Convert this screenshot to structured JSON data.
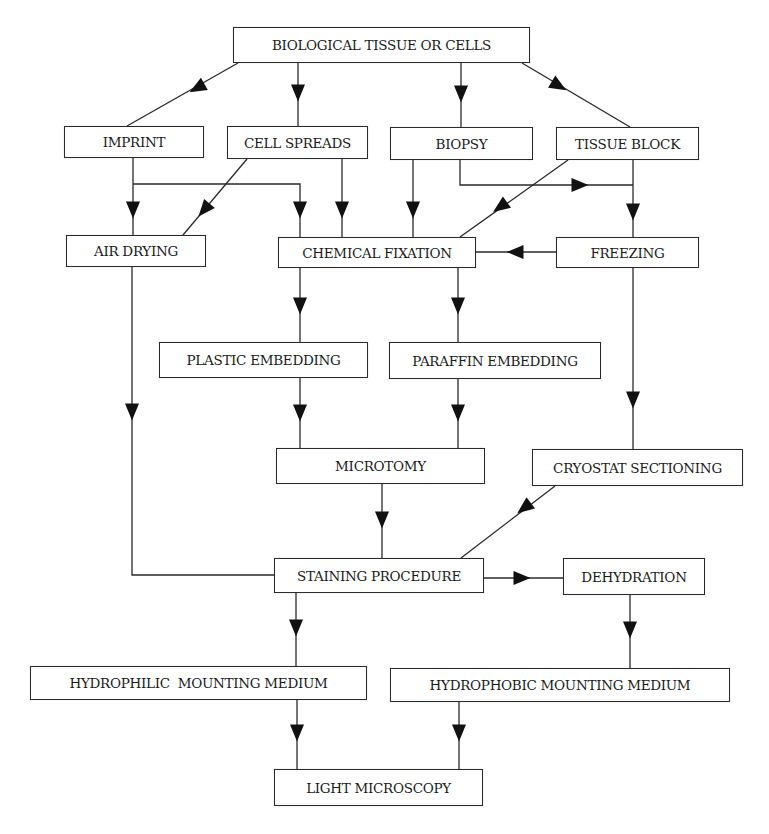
{
  "diagram": {
    "type": "flowchart",
    "colors": {
      "line": "#2a2a2a",
      "text": "#1a1a1a",
      "background": "#ffffff"
    },
    "nodes": {
      "bio": {
        "label": "BIOLOGICAL TISSUE OR CELLS",
        "x": 233,
        "y": 27,
        "w": 297,
        "h": 36
      },
      "imprint": {
        "label": "IMPRINT",
        "x": 64,
        "y": 126,
        "w": 140,
        "h": 32
      },
      "spreads": {
        "label": "CELL SPREADS",
        "x": 227,
        "y": 126,
        "w": 141,
        "h": 33
      },
      "biopsy": {
        "label": "BIOPSY",
        "x": 390,
        "y": 127,
        "w": 143,
        "h": 33
      },
      "block": {
        "label": "TISSUE BLOCK",
        "x": 556,
        "y": 127,
        "w": 143,
        "h": 33
      },
      "airdry": {
        "label": "AIR DRYING",
        "x": 66,
        "y": 235,
        "w": 140,
        "h": 32
      },
      "chemfix": {
        "label": "CHEMICAL FIXATION",
        "x": 278,
        "y": 237,
        "w": 198,
        "h": 31
      },
      "freezing": {
        "label": "FREEZING",
        "x": 556,
        "y": 237,
        "w": 143,
        "h": 31
      },
      "plastic": {
        "label": "PLASTIC EMBEDDING",
        "x": 159,
        "y": 342,
        "w": 209,
        "h": 36
      },
      "paraffin": {
        "label": "PARAFFIN EMBEDDING",
        "x": 389,
        "y": 342,
        "w": 212,
        "h": 37
      },
      "microtomy": {
        "label": "MICROTOMY",
        "x": 276,
        "y": 448,
        "w": 209,
        "h": 36
      },
      "cryostat": {
        "label": "CRYOSTAT SECTIONING",
        "x": 532,
        "y": 449,
        "w": 211,
        "h": 37
      },
      "staining": {
        "label": "STAINING PROCEDURE",
        "x": 274,
        "y": 558,
        "w": 210,
        "h": 35
      },
      "dehydration": {
        "label": "DEHYDRATION",
        "x": 563,
        "y": 558,
        "w": 142,
        "h": 37
      },
      "hydrophilic": {
        "label": "HYDROPHILIC  MOUNTING MEDIUM",
        "x": 30,
        "y": 666,
        "w": 337,
        "h": 34
      },
      "hydrophobic": {
        "label": "HYDROPHOBIC MOUNTING MEDIUM",
        "x": 390,
        "y": 668,
        "w": 340,
        "h": 34
      },
      "light": {
        "label": "LIGHT MICROSCOPY",
        "x": 274,
        "y": 769,
        "w": 209,
        "h": 37
      }
    },
    "edges": [
      {
        "from": "BIOLOGICAL TISSUE OR CELLS",
        "to": "IMPRINT",
        "points": [
          [
            238,
            63
          ],
          [
            127,
            126
          ]
        ],
        "arrow": [
          197,
          88
        ]
      },
      {
        "from": "BIOLOGICAL TISSUE OR CELLS",
        "to": "CELL SPREADS",
        "points": [
          [
            298,
            63
          ],
          [
            298,
            126
          ]
        ],
        "arrow": [
          298,
          93
        ]
      },
      {
        "from": "BIOLOGICAL TISSUE OR CELLS",
        "to": "BIOPSY",
        "points": [
          [
            461,
            63
          ],
          [
            461,
            127
          ]
        ],
        "arrow": [
          461,
          94
        ]
      },
      {
        "from": "BIOLOGICAL TISSUE OR CELLS",
        "to": "TISSUE BLOCK",
        "points": [
          [
            522,
            63
          ],
          [
            630,
            127
          ]
        ],
        "arrow": [
          559,
          86
        ]
      },
      {
        "from": "IMPRINT",
        "to": "AIR DRYING",
        "points": [
          [
            133,
            158
          ],
          [
            133,
            235
          ]
        ],
        "arrow": [
          133,
          210
        ]
      },
      {
        "from": "IMPRINT",
        "to": "CHEMICAL FIXATION",
        "points": [
          [
            133,
            184
          ],
          [
            300,
            184
          ],
          [
            300,
            237
          ]
        ],
        "arrow": [
          300,
          210
        ]
      },
      {
        "from": "CELL SPREADS",
        "to": "AIR DRYING",
        "points": [
          [
            247,
            159
          ],
          [
            183,
            235
          ]
        ],
        "arrow": [
          204,
          210
        ]
      },
      {
        "from": "CELL SPREADS",
        "to": "CHEMICAL FIXATION",
        "points": [
          [
            342,
            159
          ],
          [
            342,
            237
          ]
        ],
        "arrow": [
          342,
          210
        ]
      },
      {
        "from": "BIOPSY",
        "to": "CHEMICAL FIXATION",
        "points": [
          [
            413,
            160
          ],
          [
            413,
            237
          ]
        ],
        "arrow": [
          413,
          210
        ]
      },
      {
        "from": "BIOPSY",
        "to": "FREEZING",
        "points": [
          [
            460,
            160
          ],
          [
            460,
            185
          ],
          [
            633,
            185
          ]
        ],
        "arrow": [
          580,
          185
        ]
      },
      {
        "from": "TISSUE BLOCK",
        "to": "CHEMICAL FIXATION",
        "points": [
          [
            568,
            160
          ],
          [
            460,
            237
          ]
        ],
        "arrow": [
          500,
          207
        ]
      },
      {
        "from": "TISSUE BLOCK",
        "to": "FREEZING",
        "points": [
          [
            633,
            160
          ],
          [
            633,
            237
          ]
        ],
        "arrow": [
          633,
          212
        ]
      },
      {
        "from": "FREEZING",
        "to": "CHEMICAL FIXATION",
        "points": [
          [
            556,
            252
          ],
          [
            476,
            252
          ]
        ],
        "arrow": [
          515,
          252
        ]
      },
      {
        "from": "CHEMICAL FIXATION",
        "to": "PLASTIC EMBEDDING",
        "points": [
          [
            300,
            268
          ],
          [
            300,
            342
          ]
        ],
        "arrow": [
          300,
          306
        ]
      },
      {
        "from": "CHEMICAL FIXATION",
        "to": "PARAFFIN EMBEDDING",
        "points": [
          [
            458,
            268
          ],
          [
            458,
            342
          ]
        ],
        "arrow": [
          458,
          306
        ]
      },
      {
        "from": "AIR DRYING",
        "to": "STAINING PROCEDURE",
        "points": [
          [
            132,
            267
          ],
          [
            132,
            575
          ],
          [
            274,
            575
          ]
        ],
        "arrow": [
          132,
          412
        ]
      },
      {
        "from": "FREEZING",
        "to": "CRYOSTAT SECTIONING",
        "points": [
          [
            633,
            268
          ],
          [
            633,
            449
          ]
        ],
        "arrow": [
          633,
          400
        ]
      },
      {
        "from": "PLASTIC EMBEDDING",
        "to": "MICROTOMY",
        "points": [
          [
            300,
            378
          ],
          [
            300,
            448
          ]
        ],
        "arrow": [
          300,
          413
        ]
      },
      {
        "from": "PARAFFIN EMBEDDING",
        "to": "MICROTOMY",
        "points": [
          [
            458,
            379
          ],
          [
            458,
            448
          ]
        ],
        "arrow": [
          458,
          413
        ]
      },
      {
        "from": "MICROTOMY",
        "to": "STAINING PROCEDURE",
        "points": [
          [
            382,
            484
          ],
          [
            382,
            558
          ]
        ],
        "arrow": [
          382,
          520
        ]
      },
      {
        "from": "CRYOSTAT SECTIONING",
        "to": "STAINING PROCEDURE",
        "points": [
          [
            555,
            486
          ],
          [
            461,
            558
          ]
        ],
        "arrow": [
          524,
          508
        ]
      },
      {
        "from": "STAINING PROCEDURE",
        "to": "DEHYDRATION",
        "points": [
          [
            484,
            578
          ],
          [
            563,
            578
          ]
        ],
        "arrow": [
          522,
          578
        ]
      },
      {
        "from": "STAINING PROCEDURE",
        "to": "HYDROPHILIC  MOUNTING MEDIUM",
        "points": [
          [
            296,
            593
          ],
          [
            296,
            666
          ]
        ],
        "arrow": [
          296,
          628
        ]
      },
      {
        "from": "DEHYDRATION",
        "to": "HYDROPHOBIC MOUNTING MEDIUM",
        "points": [
          [
            630,
            595
          ],
          [
            630,
            668
          ]
        ],
        "arrow": [
          630,
          630
        ]
      },
      {
        "from": "HYDROPHILIC  MOUNTING MEDIUM",
        "to": "LIGHT MICROSCOPY",
        "points": [
          [
            297,
            700
          ],
          [
            297,
            769
          ]
        ],
        "arrow": [
          297,
          733
        ]
      },
      {
        "from": "HYDROPHOBIC MOUNTING MEDIUM",
        "to": "LIGHT MICROSCOPY",
        "points": [
          [
            459,
            702
          ],
          [
            459,
            769
          ]
        ],
        "arrow": [
          459,
          733
        ]
      }
    ]
  }
}
